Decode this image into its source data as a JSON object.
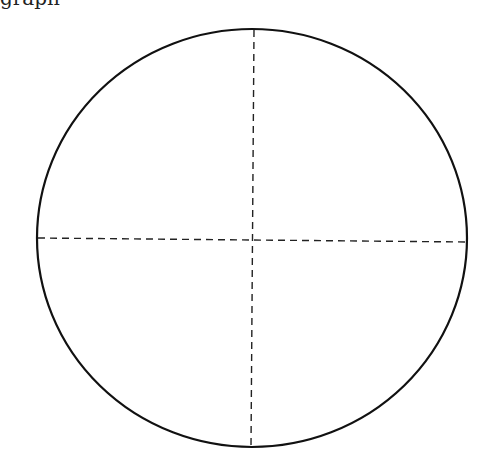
{
  "cutoff_text": "graph",
  "diagram": {
    "type": "circle-with-crosshair",
    "circle": {
      "cx": 252,
      "cy": 238,
      "rx": 215,
      "ry": 209,
      "stroke": "#111111",
      "stroke_width": 2.2
    },
    "vertical_line": {
      "x1": 254,
      "y1": 30,
      "x2": 251,
      "y2": 447,
      "style": "dashed"
    },
    "horizontal_line": {
      "x1": 38,
      "y1": 238,
      "x2": 467,
      "y2": 242,
      "style": "dashed"
    },
    "dash_color": "#222222"
  }
}
